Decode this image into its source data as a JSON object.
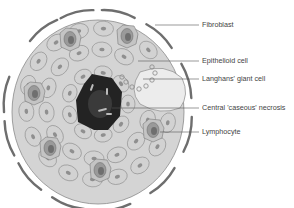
{
  "diagram": {
    "colors": {
      "cell_fill": "#d2d2d2",
      "cell_stroke": "#8a8a8a",
      "nucleus": "#8f8f8f",
      "necrosis": "#222222",
      "fibroblast": "#6e6e6e",
      "giant_cell": "#ebebeb",
      "leader_line": "#555555"
    },
    "labels": [
      {
        "id": "fibroblast",
        "text": "Fibroblast"
      },
      {
        "id": "epithelioid",
        "text": "Epithelioid cell"
      },
      {
        "id": "langhans",
        "text": "Langhans' giant cell"
      },
      {
        "id": "necrosis",
        "text": "Central 'caseous' necrosis"
      },
      {
        "id": "lymphocyte",
        "text": "Lymphocyte"
      }
    ]
  }
}
